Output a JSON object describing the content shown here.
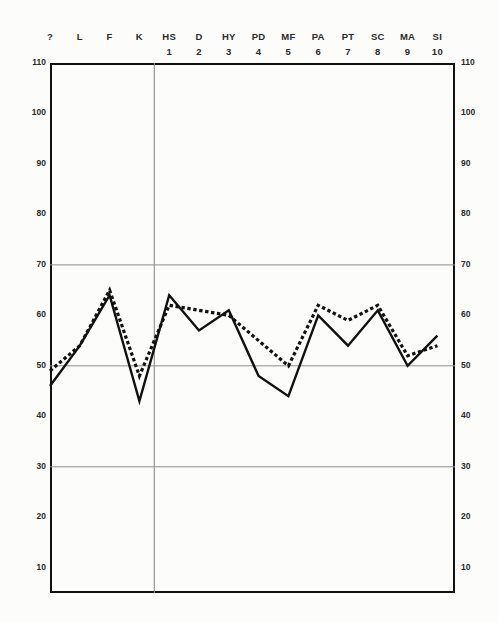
{
  "chart_data": {
    "type": "line",
    "title": "",
    "xlabel": "",
    "ylabel": "",
    "ylim": [
      5,
      110
    ],
    "xlim": [
      0,
      13
    ],
    "grid": true,
    "gridlines_y": [
      30,
      50,
      70
    ],
    "legend_position": "none",
    "axis_labels_both_sides": true,
    "categories": [
      "?",
      "L",
      "F",
      "K",
      "HS",
      "D",
      "HY",
      "PD",
      "MF",
      "PA",
      "PT",
      "SC",
      "MA",
      "SI"
    ],
    "category_numbers": [
      "",
      "",
      "",
      "",
      "1",
      "2",
      "3",
      "4",
      "5",
      "6",
      "7",
      "8",
      "9",
      "10"
    ],
    "validity_scale_divider_after": "K",
    "ytick_labels": [
      "110",
      "100",
      "90",
      "80",
      "70",
      "60",
      "50",
      "40",
      "30",
      "20",
      "10"
    ],
    "ytick_values": [
      110,
      100,
      90,
      80,
      70,
      60,
      50,
      40,
      30,
      20,
      10
    ],
    "series": [
      {
        "name": "Solid profile",
        "style": "solid",
        "color": "#111111",
        "values": [
          46,
          54,
          64,
          43,
          64,
          57,
          61,
          48,
          44,
          60,
          54,
          61,
          50,
          56
        ]
      },
      {
        "name": "Dotted profile",
        "style": "dotted",
        "color": "#111111",
        "values": [
          49,
          54,
          65,
          48,
          62,
          61,
          60,
          55,
          50,
          62,
          59,
          62,
          52,
          54
        ]
      }
    ]
  },
  "columns": [
    {
      "label": "?",
      "num": ""
    },
    {
      "label": "L",
      "num": ""
    },
    {
      "label": "F",
      "num": ""
    },
    {
      "label": "K",
      "num": ""
    },
    {
      "label": "HS",
      "num": "1"
    },
    {
      "label": "D",
      "num": "2"
    },
    {
      "label": "HY",
      "num": "3"
    },
    {
      "label": "PD",
      "num": "4"
    },
    {
      "label": "MF",
      "num": "5"
    },
    {
      "label": "PA",
      "num": "6"
    },
    {
      "label": "PT",
      "num": "7"
    },
    {
      "label": "SC",
      "num": "8"
    },
    {
      "label": "MA",
      "num": "9"
    },
    {
      "label": "SI",
      "num": "10"
    }
  ],
  "colors": {
    "ink": "#111111",
    "grid": "#8d8d8d",
    "paper": "#fcfcfb",
    "text": "#2a2a2a"
  }
}
